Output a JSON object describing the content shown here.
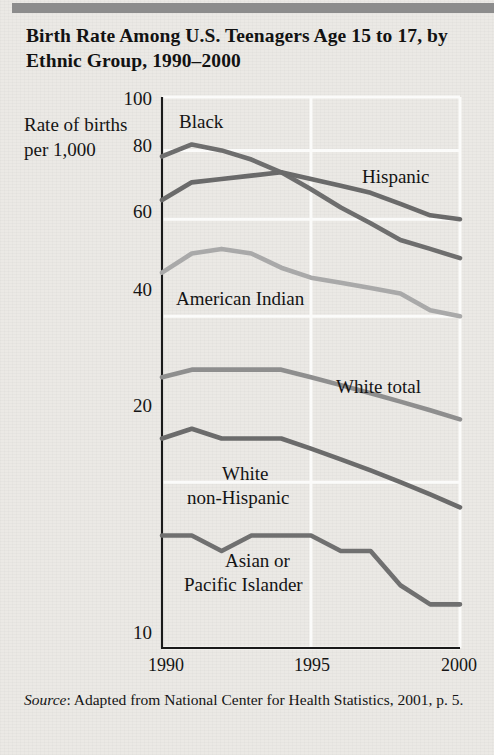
{
  "title": "Birth Rate Among U.S. Teenagers Age 15 to 17, by Ethnic Group, 1990–2000",
  "axis": {
    "y_axis_title": "Rate of births per 1,000",
    "y_ticks": [
      "100",
      "80",
      "60",
      "40",
      "20",
      "10"
    ],
    "x_ticks": [
      "1990",
      "1995",
      "2000"
    ]
  },
  "source": {
    "label": "Source",
    "text": ": Adapted from National Center for Health Statistics, 2001, p. 5."
  },
  "series_labels": {
    "black": "Black",
    "hispanic": "Hispanic",
    "american_indian": "American Indian",
    "white_total": "White total",
    "white_non_hispanic_line1": "White",
    "white_non_hispanic_line2": "non-Hispanic",
    "asian_line1": "Asian or",
    "asian_line2": "Pacific Islander"
  },
  "colors": {
    "black_line": "#6e6e6e",
    "hispanic_line": "#6a6a6a",
    "american_indian_line": "#a9a9a9",
    "white_total_line": "#8e8e8e",
    "white_non_hispanic_line": "#6b6b6b",
    "asian_line": "#707070",
    "axis": "#1a1a1a",
    "grid": "#fbfbfa",
    "page_background": "#ebe9e5",
    "top_band": "#8c8c8c"
  },
  "chart_data": {
    "type": "line",
    "title": "Birth Rate Among U.S. Teenagers Age 15 to 17, by Ethnic Group, 1990–2000",
    "xlabel": "",
    "ylabel": "Rate of births per 1,000",
    "yscale": "log",
    "ylim": [
      10,
      100
    ],
    "ytick_values": [
      100,
      80,
      60,
      40,
      20,
      10
    ],
    "xlim": [
      1990,
      2000
    ],
    "xtick_values": [
      1990,
      1995,
      2000
    ],
    "grid": true,
    "legend": "inline-labels",
    "x": [
      1990,
      1991,
      1992,
      1993,
      1994,
      1995,
      1996,
      1997,
      1998,
      1999,
      2000
    ],
    "series": [
      {
        "name": "Black",
        "color": "#6e6e6e",
        "values": [
          78,
          82,
          80,
          77,
          73,
          68,
          63,
          59,
          55,
          53,
          51
        ]
      },
      {
        "name": "Hispanic",
        "color": "#6a6a6a",
        "values": [
          65,
          70,
          71,
          72,
          73,
          71,
          69,
          67,
          64,
          61,
          60
        ]
      },
      {
        "name": "American Indian",
        "color": "#a9a9a9",
        "values": [
          48,
          52,
          53,
          52,
          49,
          47,
          46,
          45,
          44,
          41,
          40
        ]
      },
      {
        "name": "White total",
        "color": "#8e8e8e",
        "values": [
          31,
          32,
          32,
          32,
          32,
          31,
          30,
          29,
          28,
          27,
          26
        ]
      },
      {
        "name": "White non-Hispanic",
        "color": "#6b6b6b",
        "values": [
          24,
          25,
          24,
          24,
          24,
          23,
          22,
          21,
          20,
          19,
          18
        ]
      },
      {
        "name": "Asian or Pacific Islander",
        "color": "#707070",
        "values": [
          16,
          16,
          15,
          16,
          16,
          16,
          15,
          15,
          13,
          12,
          12
        ]
      }
    ]
  }
}
